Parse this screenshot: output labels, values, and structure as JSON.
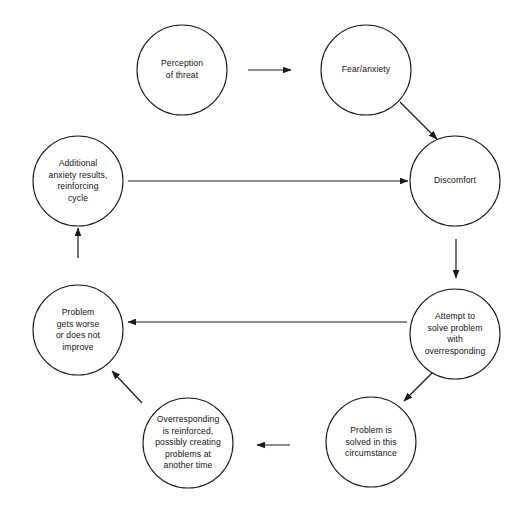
{
  "diagram": {
    "background_color": "#ffffff",
    "stroke_color": "#1a1a1a",
    "nodes": [
      {
        "id": "perception-of-threat",
        "label": "Perception\nof threat",
        "cx": 182,
        "cy": 70,
        "r": 45
      },
      {
        "id": "fear-anxiety",
        "label": "Fear/anxiety",
        "cx": 366,
        "cy": 70,
        "r": 45
      },
      {
        "id": "discomfort",
        "label": "Discomfort",
        "cx": 455,
        "cy": 181,
        "r": 45
      },
      {
        "id": "attempt-to-solve-problem",
        "label": "Attempt to\nsolve problem\nwith\noverresponding",
        "cx": 455,
        "cy": 334,
        "r": 45
      },
      {
        "id": "problem-is-solved",
        "label": "Problem is\nsolved in this\ncircumstance",
        "cx": 371,
        "cy": 442,
        "r": 45
      },
      {
        "id": "overresponding-is-reinforced",
        "label": "Overresponding\nis reinforced,\npossibly creating\nproblems at\nanother time",
        "cx": 188,
        "cy": 443,
        "r": 45
      },
      {
        "id": "problem-gets-worse",
        "label": "Problem\ngets worse\nor does not\nimprove",
        "cx": 78,
        "cy": 330,
        "r": 45
      },
      {
        "id": "additional-anxiety-results",
        "label": "Additional\nanxiety results,\nreinforcing\ncycle",
        "cx": 78,
        "cy": 181,
        "r": 45
      }
    ],
    "arrows": [
      {
        "id": "perception-to-fear",
        "from": "perception-of-threat",
        "to": "fear-anxiety",
        "x1": 248,
        "y1": 70,
        "x2": 291,
        "y2": 70
      },
      {
        "id": "fear-to-discomfort",
        "from": "fear-anxiety",
        "to": "discomfort",
        "x1": 400,
        "y1": 102,
        "x2": 437,
        "y2": 139
      },
      {
        "id": "discomfort-to-attempt",
        "from": "discomfort",
        "to": "attempt-to-solve-problem",
        "x1": 456,
        "y1": 239,
        "x2": 456,
        "y2": 278
      },
      {
        "id": "attempt-to-problem-solved",
        "from": "attempt-to-solve-problem",
        "to": "problem-is-solved",
        "x1": 432,
        "y1": 373,
        "x2": 404,
        "y2": 401
      },
      {
        "id": "problem-solved-to-overresponding",
        "from": "problem-is-solved",
        "to": "overresponding-is-reinforced",
        "x1": 290,
        "y1": 445,
        "x2": 257,
        "y2": 445
      },
      {
        "id": "overresponding-to-problem-worse",
        "from": "overresponding-is-reinforced",
        "to": "problem-gets-worse",
        "x1": 142,
        "y1": 403,
        "x2": 112,
        "y2": 371
      },
      {
        "id": "problem-worse-to-additional-anxiety",
        "from": "problem-gets-worse",
        "to": "additional-anxiety-results",
        "x1": 78,
        "y1": 258,
        "x2": 78,
        "y2": 228
      },
      {
        "id": "additional-anxiety-to-discomfort",
        "from": "additional-anxiety-results",
        "to": "discomfort",
        "x1": 128,
        "y1": 181,
        "x2": 408,
        "y2": 181
      },
      {
        "id": "attempt-to-problem-worse",
        "from": "attempt-to-solve-problem",
        "to": "problem-gets-worse",
        "x1": 407,
        "y1": 322,
        "x2": 128,
        "y2": 322
      }
    ]
  }
}
